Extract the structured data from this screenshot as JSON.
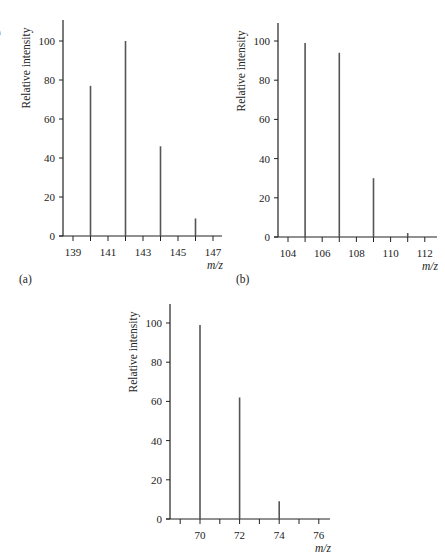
{
  "chart_data": [
    {
      "id": "a",
      "type": "bar",
      "subtype": "mass-spectrum-stick",
      "panel_label": "(a)",
      "xlabel": "m/z",
      "ylabel": "Relative intensity",
      "x_ticks": [
        139,
        141,
        143,
        145,
        147
      ],
      "y_ticks": [
        0,
        20,
        40,
        60,
        80,
        100
      ],
      "xlim": [
        138.4,
        147.6
      ],
      "ylim": [
        0,
        110
      ],
      "grid": false,
      "x": [
        140,
        142,
        144,
        146
      ],
      "values": [
        77,
        100,
        46,
        9
      ],
      "layout": {
        "axis_x": 63,
        "base_y": 236,
        "top_y": 20,
        "px_per_y": 1.95,
        "x0_val": 139,
        "x0_px": 73,
        "px_per_x": 17.5,
        "x_end": 222
      }
    },
    {
      "id": "b",
      "type": "bar",
      "subtype": "mass-spectrum-stick",
      "panel_label": "(b)",
      "xlabel": "m/z",
      "ylabel": "Relative intensity",
      "x_ticks": [
        104,
        106,
        108,
        110,
        112
      ],
      "y_ticks": [
        0,
        20,
        40,
        60,
        80,
        100
      ],
      "xlim": [
        103.4,
        112.7
      ],
      "ylim": [
        0,
        110
      ],
      "grid": false,
      "x": [
        105,
        107,
        109,
        111
      ],
      "values": [
        99,
        94,
        30,
        2
      ],
      "layout": {
        "axis_x": 278,
        "base_y": 237,
        "top_y": 23,
        "px_per_y": 1.96,
        "x0_val": 104,
        "x0_px": 288,
        "px_per_x": 17.1,
        "x_end": 437
      }
    },
    {
      "id": "c",
      "type": "bar",
      "subtype": "mass-spectrum-stick",
      "panel_label": "",
      "xlabel": "m/z",
      "ylabel": "Relative intensity",
      "x_ticks": [
        70,
        72,
        74,
        76
      ],
      "y_ticks": [
        0,
        20,
        40,
        60,
        80,
        100
      ],
      "xlim": [
        68.5,
        76.5
      ],
      "ylim": [
        0,
        110
      ],
      "grid": false,
      "x": [
        70,
        72,
        74
      ],
      "values": [
        99,
        62,
        9
      ],
      "layout": {
        "axis_x": 170,
        "base_y": 519,
        "top_y": 304,
        "px_per_y": 1.96,
        "x0_val": 70,
        "x0_px": 200,
        "px_per_x": 19.8,
        "x_end": 330
      }
    }
  ],
  "panels": {
    "a_label": "(a)",
    "b_label": "(b)",
    "stray_mark": "a"
  },
  "colors": {
    "axis": "#222222",
    "bar": "#555555",
    "text": "#222222"
  }
}
